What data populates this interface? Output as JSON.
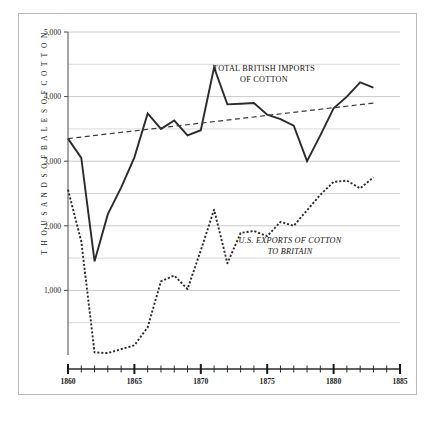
{
  "chart_data": {
    "type": "line",
    "title": "",
    "xlabel": "",
    "ylabel": "THOUSANDS OF BALES OF COTTON",
    "xlim": [
      1860,
      1885
    ],
    "ylim": [
      0,
      5000
    ],
    "grid": true,
    "grid_interval": 500,
    "y_ticks": [
      1000,
      2000,
      3000,
      4000,
      5000
    ],
    "y_tick_labels": [
      "1,000",
      "2,000",
      "3,000",
      "4,000",
      "5,000"
    ],
    "x_ticks": [
      1860,
      1865,
      1870,
      1875,
      1880,
      1885
    ],
    "x_tick_labels": [
      "1860",
      "1865",
      "1870",
      "1875",
      "1880",
      "1885"
    ],
    "x_minor_ticks": [
      1861,
      1862,
      1863,
      1864,
      1866,
      1867,
      1868,
      1869,
      1871,
      1872,
      1873,
      1874,
      1876,
      1877,
      1878,
      1879,
      1881,
      1882,
      1883,
      1884
    ],
    "legend_position": "inline-annotation",
    "series": [
      {
        "name": "TOTAL  BRITISH IMPORTS OF COTTON",
        "style": "solid",
        "color": "#2b2b2b",
        "x": [
          1860,
          1861,
          1862,
          1863,
          1864,
          1865,
          1866,
          1867,
          1868,
          1869,
          1870,
          1871,
          1872,
          1873,
          1874,
          1875,
          1876,
          1877,
          1878,
          1879,
          1880,
          1881,
          1882,
          1883
        ],
        "values": [
          3350,
          3050,
          1450,
          2180,
          2590,
          3060,
          3740,
          3500,
          3630,
          3400,
          3480,
          4450,
          3880,
          3890,
          3900,
          3720,
          3650,
          3550,
          3000,
          3400,
          3820,
          4000,
          4220,
          4140
        ]
      },
      {
        "name": "U.S. EXPORTS OF COTTON TO BRITAIN",
        "style": "dotted",
        "color": "#2b2b2b",
        "x": [
          1860,
          1861,
          1862,
          1863,
          1864,
          1865,
          1866,
          1867,
          1868,
          1869,
          1870,
          1871,
          1872,
          1873,
          1874,
          1875,
          1876,
          1877,
          1878,
          1879,
          1880,
          1881,
          1882,
          1883
        ],
        "values": [
          2560,
          1760,
          40,
          30,
          90,
          150,
          430,
          1140,
          1230,
          1020,
          1620,
          2250,
          1420,
          1890,
          1920,
          1840,
          2060,
          2000,
          2240,
          2480,
          2680,
          2700,
          2580,
          2750
        ]
      },
      {
        "name": "trend",
        "style": "dashed",
        "color": "#3a3a3a",
        "x": [
          1860,
          1883
        ],
        "values": [
          3350,
          3900
        ]
      }
    ],
    "annotations": [
      {
        "name": "british-imports-label",
        "lines": [
          "TOTAL  BRITISH IMPORTS",
          "OF COTTON"
        ],
        "x": 1875.2,
        "y": 4230,
        "style": "normal"
      },
      {
        "name": "us-exports-label",
        "lines": [
          "U.S. EXPORTS OF COTTON",
          "TO BRITAIN"
        ],
        "x": 1875.0,
        "y": 1810,
        "style": "italic"
      }
    ]
  },
  "axis": {
    "y_label_text": "T H O U S A N D S   O F   B A L E S   O F   C O T T O N",
    "y_tick_1000": "1,000",
    "y_tick_2000": "2,000",
    "y_tick_3000": "3,000",
    "y_tick_4000": "4,000",
    "y_tick_5000": "5,000",
    "x_tick_1860": "1860",
    "x_tick_1865": "1865",
    "x_tick_1870": "1870",
    "x_tick_1875": "1875",
    "x_tick_1880": "1880",
    "x_tick_1885": "1885"
  },
  "annotations": {
    "imports_line1": "TOTAL  BRITISH IMPORTS",
    "imports_line2": "OF COTTON",
    "exports_line1": "U.S. EXPORTS OF COTTON",
    "exports_line2": "TO BRITAIN"
  },
  "colors": {
    "series_ink": "#2b2b2b",
    "grid": "#c4c4c4",
    "frame": "#b9b9b9",
    "axis": "#4a4a4a",
    "text": "#1a1a1a"
  }
}
